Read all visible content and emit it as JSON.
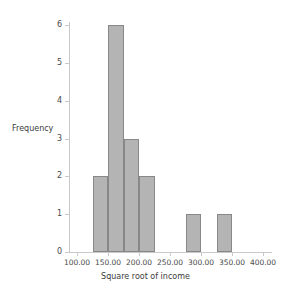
{
  "chart_data": {
    "type": "bar",
    "title": "",
    "xlabel": "Square root of income",
    "ylabel": "Frequency",
    "xlim": [
      100,
      400
    ],
    "ylim": [
      0,
      6
    ],
    "grid": false,
    "legend": "none",
    "bin_width": 25,
    "x_ticks": [
      {
        "value": 100,
        "label": "100.00"
      },
      {
        "value": 150,
        "label": "150.00"
      },
      {
        "value": 200,
        "label": "200.00"
      },
      {
        "value": 250,
        "label": "250.00"
      },
      {
        "value": 300,
        "label": "300.00"
      },
      {
        "value": 350,
        "label": "350.00"
      },
      {
        "value": 400,
        "label": "400.00"
      }
    ],
    "y_ticks": [
      {
        "value": 0,
        "label": "0"
      },
      {
        "value": 1,
        "label": "1"
      },
      {
        "value": 2,
        "label": "2"
      },
      {
        "value": 3,
        "label": "3"
      },
      {
        "value": 4,
        "label": "4"
      },
      {
        "value": 5,
        "label": "5"
      },
      {
        "value": 6,
        "label": "6"
      }
    ],
    "bins": [
      {
        "start": 125,
        "end": 150,
        "value": 2
      },
      {
        "start": 150,
        "end": 175,
        "value": 6
      },
      {
        "start": 175,
        "end": 200,
        "value": 3
      },
      {
        "start": 200,
        "end": 225,
        "value": 2
      },
      {
        "start": 275,
        "end": 300,
        "value": 1
      },
      {
        "start": 325,
        "end": 350,
        "value": 1
      }
    ],
    "categories": [
      "125-150",
      "150-175",
      "175-200",
      "200-225",
      "275-300",
      "325-350"
    ],
    "values": [
      2,
      6,
      3,
      2,
      1,
      1
    ],
    "colors": {
      "bar_fill": "#b4b4b4",
      "bar_border": "#888888",
      "axis": "#c9c9c9",
      "text": "#3b3b3b",
      "background": "#ffffff"
    }
  }
}
